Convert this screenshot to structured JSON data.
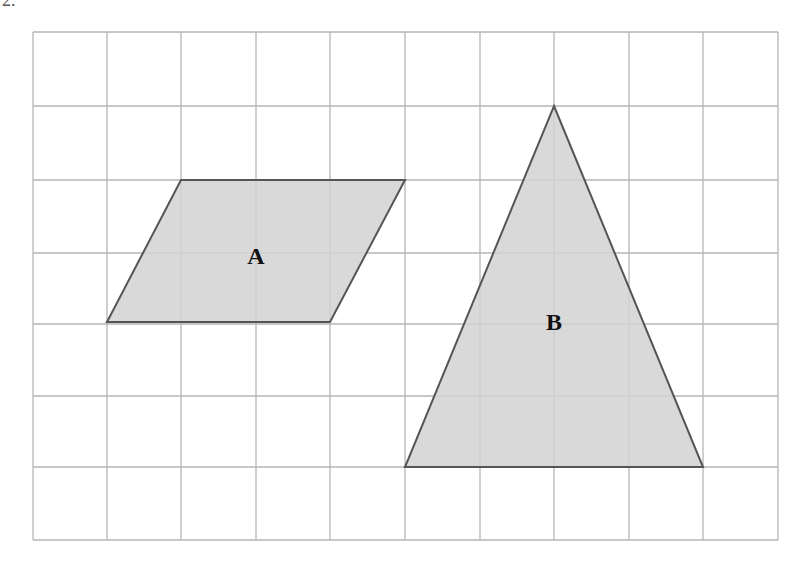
{
  "question_number": "2.",
  "grid": {
    "cols": 10,
    "rows": 7,
    "x_lines": [
      33,
      107,
      181,
      256,
      330,
      405,
      480,
      554,
      629,
      703,
      778
    ],
    "y_lines": [
      32,
      106,
      180,
      253,
      324,
      396,
      467,
      540
    ],
    "line_color": "#b5b5b5"
  },
  "shapes": [
    {
      "name": "parallelogram",
      "label": "A",
      "points": "181,180 405,180 330,322 107,322",
      "label_pos": [
        256,
        264
      ],
      "fill": "#d2d2d2",
      "stroke": "#555555"
    },
    {
      "name": "triangle",
      "label": "B",
      "points": "554,106 703,467 405,467",
      "label_pos": [
        554,
        330
      ],
      "fill": "#d2d2d2",
      "stroke": "#555555"
    }
  ]
}
